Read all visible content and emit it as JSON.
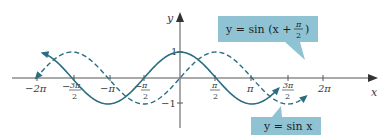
{
  "chart_data": {
    "type": "line",
    "title": "",
    "xlabel": "x",
    "ylabel": "y",
    "xlim": [
      -6.6,
      7.0
    ],
    "ylim": [
      -1.3,
      1.3
    ],
    "grid": false,
    "x_ticks": [
      {
        "value": -6.2832,
        "label": "−2π"
      },
      {
        "value": -4.7124,
        "label": "−3π/2"
      },
      {
        "value": -3.1416,
        "label": "−π"
      },
      {
        "value": -1.5708,
        "label": "−π/2"
      },
      {
        "value": 1.5708,
        "label": "π/2"
      },
      {
        "value": 3.1416,
        "label": "π"
      },
      {
        "value": 4.7124,
        "label": "3π/2"
      },
      {
        "value": 6.2832,
        "label": "2π"
      }
    ],
    "y_ticks": [
      {
        "value": 1,
        "label": "1"
      },
      {
        "value": -1,
        "label": "−1"
      }
    ],
    "series": [
      {
        "name": "y = sin(x + π/2)",
        "style": "solid",
        "color": "#2a6e80",
        "x_range": [
          -6.0,
          4.3
        ],
        "function": "sin(x + pi/2)"
      },
      {
        "name": "y = sin x",
        "style": "dashed",
        "color": "#2a6e80",
        "x_range": [
          -6.2832,
          5.5
        ],
        "function": "sin(x)"
      }
    ],
    "annotations": [
      {
        "text": "y = sin (x + π/2)",
        "target_series": "y = sin(x + π/2)",
        "box_color": "#8fc3d4"
      },
      {
        "text": "y = sin x",
        "target_series": "y = sin x",
        "box_color": "#8fc3d4"
      }
    ]
  },
  "labels": {
    "x_axis": "x",
    "y_axis": "y",
    "y_one": "1",
    "y_neg_one": "−1",
    "callout_shift_prefix": "y = sin (x + ",
    "callout_shift_num": "π",
    "callout_shift_den": "2",
    "callout_shift_suffix": ")",
    "callout_sin": "y = sin x",
    "tick_neg_2pi": "−2π",
    "tick_neg_3pi2_num": "3π",
    "tick_neg_3pi2_den": "2",
    "tick_neg_pi": "−π",
    "tick_neg_pi2_num": "π",
    "tick_neg_pi2_den": "2",
    "tick_pi2_num": "π",
    "tick_pi2_den": "2",
    "tick_pi": "π",
    "tick_3pi2_num": "3π",
    "tick_3pi2_den": "2",
    "tick_2pi": "2π",
    "minus": "−"
  },
  "colors": {
    "curve": "#2a6e80",
    "axis": "#555555",
    "callout_fill": "#8fc3d4"
  }
}
